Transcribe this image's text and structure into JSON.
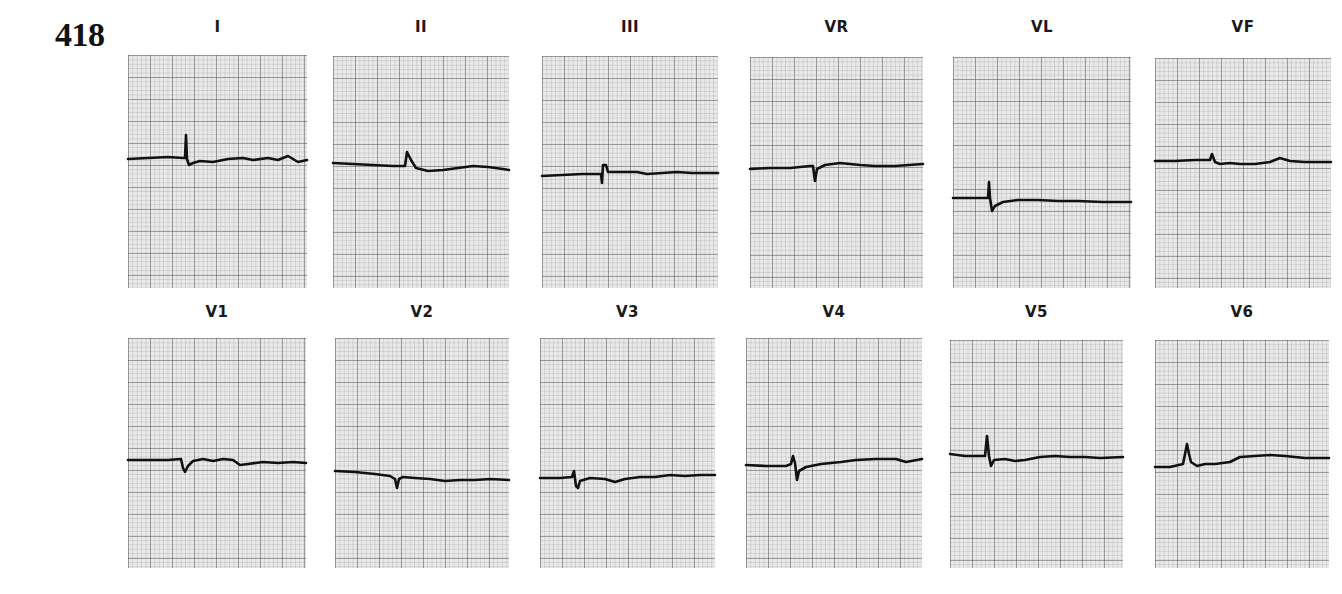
{
  "figure": {
    "number": "418",
    "paper_color": "#e9e9e9",
    "trace_color": "#111111"
  },
  "leads": [
    {
      "label": "I",
      "x": 128,
      "label_y": 18,
      "paper_y": 55,
      "w": 179,
      "h": 233,
      "trace": "M0,104 L20,103 L40,102 L55,103 L57,103 L58,80 L59,104 L61,110 L65,108 L72,106 L85,107 L100,104 L115,103 L125,105 L140,103 L150,105 L160,101 L170,107 L179,105"
    },
    {
      "label": "II",
      "x": 333,
      "label_y": 18,
      "paper_y": 56,
      "w": 176,
      "h": 232,
      "trace": "M0,107 L20,108 L40,109 L60,110 L72,110 L74,96 L78,104 L83,112 L95,115 L110,114 L125,112 L140,110 L155,111 L170,113 L176,114"
    },
    {
      "label": "III",
      "x": 542,
      "label_y": 18,
      "paper_y": 56,
      "w": 176,
      "h": 232,
      "trace": "M0,120 L20,119 L40,118 L57,118 L59,118 L60,127 L61,109 L64,109 L66,116 L75,116 L95,116 L105,118 L120,117 L135,116 L150,117 L176,117"
    },
    {
      "label": "VR",
      "x": 750,
      "label_y": 18,
      "paper_y": 57,
      "w": 173,
      "h": 231,
      "trace": "M0,112 L20,111 L40,111 L60,109 L63,109 L65,124 L67,112 L75,108 L90,106 L110,108 L125,109 L145,109 L173,107"
    },
    {
      "label": "VL",
      "x": 953,
      "label_y": 18,
      "paper_y": 57,
      "w": 178,
      "h": 231,
      "trace": "M0,141 L20,141 L35,141 L36,125 L37,141 L39,154 L42,149 L50,145 L65,143 L85,143 L105,144 L125,144 L150,145 L178,145"
    },
    {
      "label": "VF",
      "x": 1155,
      "label_y": 18,
      "paper_y": 58,
      "w": 176,
      "h": 230,
      "trace": "M0,103 L20,103 L40,102 L55,102 L57,96 L60,104 L65,106 L75,105 L85,106 L100,106 L115,104 L125,100 L135,103 L150,104 L176,104"
    },
    {
      "label": "V1",
      "x": 128,
      "label_y": 303,
      "paper_y": 338,
      "w": 178,
      "h": 230,
      "trace": "M0,122 L20,122 L40,122 L53,121 L55,130 L57,134 L60,128 L65,123 L75,121 L85,123 L95,121 L105,122 L112,127 L120,126 L135,124 L150,125 L165,124 L178,125"
    },
    {
      "label": "V2",
      "x": 335,
      "label_y": 303,
      "paper_y": 338,
      "w": 174,
      "h": 230,
      "trace": "M0,133 L20,134 L40,136 L55,138 L60,141 L62,150 L64,141 L68,139 L80,140 L95,141 L110,143 L125,142 L140,142 L155,141 L174,142"
    },
    {
      "label": "V3",
      "x": 540,
      "label_y": 303,
      "paper_y": 338,
      "w": 175,
      "h": 230,
      "trace": "M0,140 L20,140 L32,139 L34,133 L36,148 L38,150 L40,143 L50,140 L65,141 L75,144 L85,141 L100,139 L115,139 L130,137 L145,138 L160,137 L175,137"
    },
    {
      "label": "V4",
      "x": 746,
      "label_y": 303,
      "paper_y": 338,
      "w": 176,
      "h": 230,
      "trace": "M0,127 L20,128 L40,128 L45,126 L47,118 L49,125 L51,142 L53,133 L60,129 L75,126 L95,124 L110,122 L130,121 L150,121 L160,124 L176,121"
    },
    {
      "label": "V5",
      "x": 950,
      "label_y": 303,
      "paper_y": 340,
      "w": 173,
      "h": 228,
      "trace": "M0,114 L15,116 L35,116 L37,96 L39,116 L41,126 L44,120 L55,119 L65,121 L75,120 L90,117 L105,116 L120,117 L135,117 L150,118 L173,117"
    },
    {
      "label": "V6",
      "x": 1155,
      "label_y": 303,
      "paper_y": 340,
      "w": 174,
      "h": 228,
      "trace": "M0,127 L15,127 L28,124 L30,114 L32,104 L34,114 L36,122 L42,126 L50,124 L60,124 L75,122 L85,117 L100,116 L115,115 L130,116 L150,118 L174,118"
    }
  ]
}
